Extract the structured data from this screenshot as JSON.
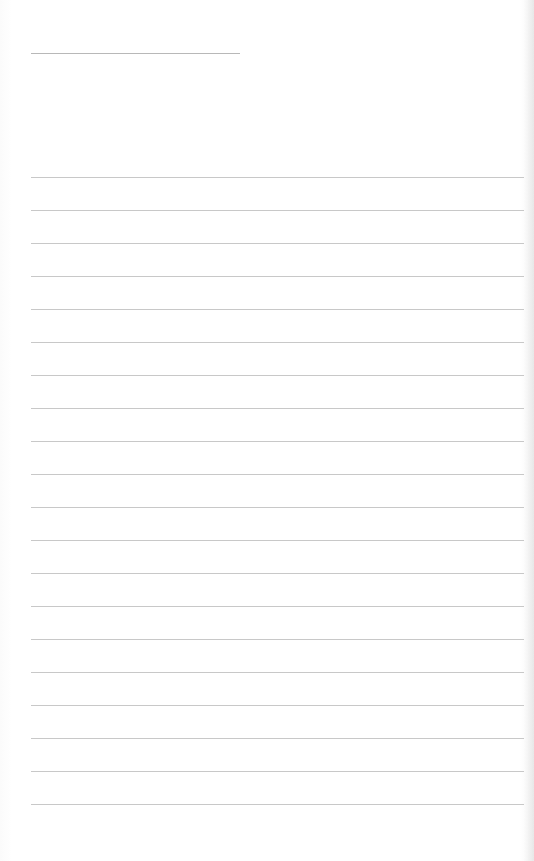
{
  "page": {
    "type": "blank lined sheet",
    "title_line": {
      "x": 31,
      "y": 53,
      "width": 209
    },
    "rules": {
      "count": 20,
      "first_y": 177,
      "spacing": 33,
      "left": 31,
      "width": 493
    },
    "colors": {
      "background": "#ffffff",
      "rule": "#c8c8c8",
      "title_line": "#b8b8b8"
    }
  }
}
